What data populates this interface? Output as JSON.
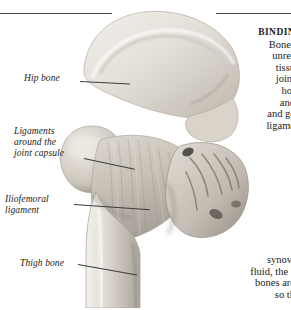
{
  "figure": {
    "rules": {
      "left_rule": "",
      "right_rule": ""
    }
  },
  "labels": [
    {
      "id": "hip-bone",
      "text": "Hip bone"
    },
    {
      "id": "ligaments",
      "text": "Ligaments\naround the\njoint capsule"
    },
    {
      "id": "iliofemoral",
      "text": "Iliofemoral\nligament"
    },
    {
      "id": "thigh-bone",
      "text": "Thigh bone"
    }
  ],
  "body_top": {
    "heading": "BINDIN",
    "lines": [
      "Bones",
      "unres",
      "tissu",
      "joint",
      "hol",
      "and",
      "and ge",
      "ligame"
    ]
  },
  "body_bottom": {
    "lines": [
      "synovi",
      "fluid, the \"",
      "bones are",
      "so th"
    ]
  },
  "colors": {
    "bone_light": "#e9e6e0",
    "bone_mid": "#cfc9c0",
    "bone_shadow": "#9c958c",
    "ligament": "#c9c3ba",
    "rule": "#4a4a4a",
    "text": "#1b1b1b"
  }
}
